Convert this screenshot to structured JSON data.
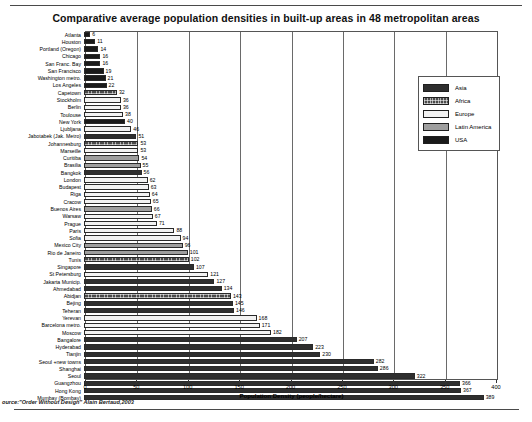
{
  "chart_data": {
    "type": "bar",
    "orientation": "horizontal",
    "title": "Comparative  average population densities in built-up areas in 48 metropolitan areas",
    "xlabel": "Population Density (people/hectare)",
    "ylabel": "",
    "xlim": [
      0,
      400
    ],
    "xticks": [
      0,
      50,
      100,
      150,
      200,
      250,
      300,
      350,
      400
    ],
    "grid": true,
    "legend_position": "top-right",
    "source": "ource:\"Order Without Design\" Alain Bertaud,2003",
    "categories": [
      "Atlanta",
      "Houston",
      "Portland (Oregon)",
      "Chicago",
      "San Franc. Bay",
      "San Francisco",
      "Washington metro.",
      "Los Angeles",
      "Capetown",
      "Stockholm",
      "Berlin",
      "Toulouse",
      "New York",
      "Ljubljana",
      "Jabotabek (Jak. Metro)",
      "Johannesburg",
      "Marseille",
      "Curitiba",
      "Brasilia",
      "Bangkok",
      "London",
      "Budapest",
      "Riga",
      "Cracow",
      "Buenos Aires",
      "Warsaw",
      "Prague",
      "Paris",
      "Sofia",
      "Mexico City",
      "Rio de Janeiro",
      "Tunis",
      "Singapore",
      "St Petersburg",
      "Jakarta Municip.",
      "Ahmedabad",
      "Abidjan",
      "Bejing",
      "Teheran",
      "Yerevan",
      "Barcelona metro.",
      "Moscow",
      "Bangalore",
      "Hyderabad",
      "Tianjin",
      "Seoul +new towns",
      "Shanghai",
      "Seoul",
      "Guangzhou",
      "Hong Kong",
      "Mumbay (Bombay)"
    ],
    "values": [
      6,
      11,
      14,
      16,
      16,
      19,
      21,
      22,
      32,
      36,
      36,
      38,
      40,
      46,
      51,
      53,
      53,
      54,
      55,
      56,
      62,
      63,
      64,
      65,
      66,
      67,
      71,
      88,
      94,
      96,
      101,
      102,
      107,
      121,
      127,
      134,
      143,
      145,
      146,
      168,
      171,
      182,
      207,
      223,
      230,
      282,
      286,
      322,
      366,
      367,
      389
    ],
    "regions": [
      "USA",
      "USA",
      "USA",
      "USA",
      "USA",
      "USA",
      "USA",
      "USA",
      "Africa",
      "Europe",
      "Europe",
      "Europe",
      "USA",
      "Europe",
      "Asia",
      "Africa",
      "Europe",
      "Latin America",
      "Latin America",
      "Asia",
      "Europe",
      "Europe",
      "Europe",
      "Europe",
      "Latin America",
      "Europe",
      "Europe",
      "Europe",
      "Europe",
      "Latin America",
      "Latin America",
      "Africa",
      "Asia",
      "Europe",
      "Asia",
      "Asia",
      "Africa",
      "Asia",
      "Asia",
      "Europe",
      "Europe",
      "Europe",
      "Asia",
      "Asia",
      "Asia",
      "Asia",
      "Asia",
      "Asia",
      "Asia",
      "Asia",
      "Asia"
    ],
    "legend": [
      {
        "label": "Asia",
        "color": "#2e2e2e",
        "key": "asia"
      },
      {
        "label": "Africa",
        "color": "#4a4a4a",
        "key": "africa"
      },
      {
        "label": "Europe",
        "color": "#f2f2f2",
        "key": "europe"
      },
      {
        "label": "Latin America",
        "color": "#9e9e9e",
        "key": "latin"
      },
      {
        "label": "USA",
        "color": "#1a1a1a",
        "key": "usa"
      }
    ]
  }
}
